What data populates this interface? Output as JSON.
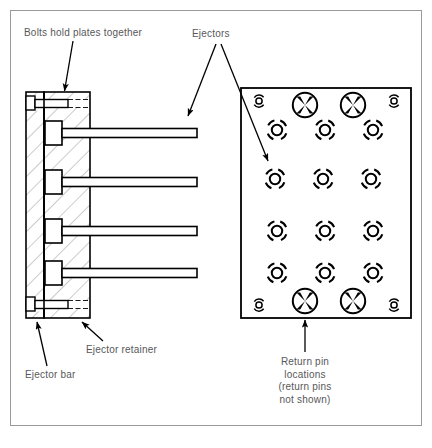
{
  "figure": {
    "border_color": "#9a9a9a",
    "line_color": "#000000",
    "hatch_color": "#8c8c8c",
    "text_color": "#58585a",
    "background": "#ffffff"
  },
  "labels": {
    "bolts": "Bolts hold plates together",
    "ejectors": "Ejectors",
    "ejector_retainer": "Ejector retainer",
    "ejector_bar": "Ejector bar",
    "return_pin_line1": "Return pin",
    "return_pin_line2": "locations",
    "return_pin_line3": "(return pins",
    "return_pin_line4": "not shown)"
  },
  "cross_section": {
    "name": "ejector assembly cross-section",
    "ejector_bar": {
      "x": 26,
      "y": 92,
      "width": 18,
      "height": 226
    },
    "ejector_retainer": {
      "x": 44,
      "y": 92,
      "width": 46,
      "height": 226
    },
    "bolts": [
      {
        "name": "top-bolt",
        "head_y": 99,
        "shank_y": 103
      },
      {
        "name": "bottom-bolt",
        "head_y": 300,
        "shank_y": 304
      }
    ],
    "ejector_pins": [
      {
        "name": "ejector-pin-1",
        "head_center_y": 133,
        "rod_end_x": 197
      },
      {
        "name": "ejector-pin-2",
        "head_center_y": 182,
        "rod_end_x": 197
      },
      {
        "name": "ejector-pin-3",
        "head_center_y": 231,
        "rod_end_x": 197
      },
      {
        "name": "ejector-pin-4",
        "head_center_y": 273,
        "rod_end_x": 197
      }
    ]
  },
  "plan_view": {
    "name": "ejector plate plan view",
    "plate": {
      "x": 241,
      "y": 88,
      "width": 170,
      "height": 230
    },
    "return_pins": [
      {
        "cx": 305,
        "cy": 105
      },
      {
        "cx": 353,
        "cy": 105
      },
      {
        "cx": 305,
        "cy": 301
      },
      {
        "cx": 353,
        "cy": 301
      }
    ],
    "corner_holes": [
      {
        "cx": 259,
        "cy": 101
      },
      {
        "cx": 394,
        "cy": 101
      },
      {
        "cx": 259,
        "cy": 305
      },
      {
        "cx": 394,
        "cy": 305
      }
    ],
    "ejector_pin_rows": [
      {
        "cy": 130,
        "cx": [
          277,
          325,
          373
        ]
      },
      {
        "cy": 179,
        "cx": [
          275,
          323,
          371
        ]
      },
      {
        "cy": 231,
        "cx": [
          277,
          325,
          373
        ]
      },
      {
        "cy": 273,
        "cx": [
          277,
          325,
          373
        ]
      }
    ]
  },
  "icons": {
    "return_pin": "circle-with-x-icon",
    "ejector_pin": "dashed-ring-circle-icon",
    "corner_hole": "small-dashed-circle-icon",
    "leader_arrow": "arrow-icon"
  }
}
